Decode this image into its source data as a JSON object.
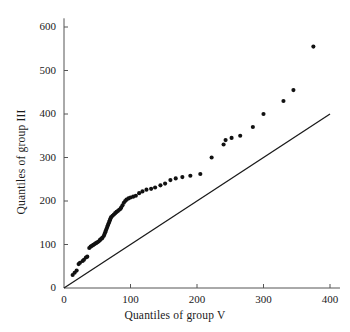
{
  "chart_data": {
    "type": "scatter",
    "title": "",
    "xlabel": "Quantiles of group V",
    "ylabel": "Quantiles of group III",
    "xlim": [
      0,
      415
    ],
    "ylim": [
      0,
      620
    ],
    "xticks": [
      0,
      100,
      200,
      300,
      400
    ],
    "yticks": [
      0,
      100,
      200,
      300,
      400,
      500,
      600
    ],
    "xticklabels": [
      "0",
      "100",
      "200",
      "300",
      "400"
    ],
    "yticklabels": [
      "0",
      "100",
      "200",
      "300",
      "400",
      "500",
      "600"
    ],
    "grid": false,
    "legend": null,
    "marker": "filled-circle",
    "marker_color": "#111111",
    "marker_size": 3,
    "axis_color": "#555555",
    "reference_line": {
      "name": "y = x line",
      "x": [
        0,
        400
      ],
      "y": [
        0,
        400
      ],
      "color": "#1a1a1a",
      "width": 1.3
    },
    "points": [
      [
        13,
        30
      ],
      [
        16,
        35
      ],
      [
        19,
        40
      ],
      [
        22,
        55
      ],
      [
        24,
        58
      ],
      [
        28,
        62
      ],
      [
        30,
        65
      ],
      [
        33,
        70
      ],
      [
        35,
        72
      ],
      [
        38,
        92
      ],
      [
        40,
        95
      ],
      [
        42,
        97
      ],
      [
        44,
        99
      ],
      [
        46,
        101
      ],
      [
        48,
        103
      ],
      [
        50,
        105
      ],
      [
        52,
        107
      ],
      [
        54,
        110
      ],
      [
        55,
        112
      ],
      [
        57,
        114
      ],
      [
        58,
        116
      ],
      [
        60,
        120
      ],
      [
        61,
        124
      ],
      [
        62,
        128
      ],
      [
        63,
        132
      ],
      [
        64,
        136
      ],
      [
        65,
        140
      ],
      [
        66,
        144
      ],
      [
        67,
        148
      ],
      [
        68,
        152
      ],
      [
        69,
        156
      ],
      [
        70,
        160
      ],
      [
        71,
        163
      ],
      [
        73,
        166
      ],
      [
        75,
        169
      ],
      [
        77,
        172
      ],
      [
        79,
        175
      ],
      [
        81,
        177
      ],
      [
        83,
        180
      ],
      [
        85,
        182
      ],
      [
        86,
        185
      ],
      [
        88,
        190
      ],
      [
        90,
        196
      ],
      [
        92,
        200
      ],
      [
        94,
        203
      ],
      [
        97,
        206
      ],
      [
        100,
        208
      ],
      [
        104,
        210
      ],
      [
        108,
        212
      ],
      [
        113,
        218
      ],
      [
        118,
        222
      ],
      [
        124,
        226
      ],
      [
        131,
        228
      ],
      [
        137,
        231
      ],
      [
        145,
        236
      ],
      [
        152,
        240
      ],
      [
        160,
        248
      ],
      [
        168,
        252
      ],
      [
        178,
        255
      ],
      [
        190,
        258
      ],
      [
        205,
        262
      ],
      [
        222,
        300
      ],
      [
        240,
        330
      ],
      [
        243,
        340
      ],
      [
        252,
        345
      ],
      [
        265,
        350
      ],
      [
        284,
        370
      ],
      [
        300,
        400
      ],
      [
        330,
        430
      ],
      [
        345,
        455
      ],
      [
        375,
        555
      ]
    ],
    "series_name": "sample quantiles"
  },
  "axis": {
    "x_title": "Quantiles of group V",
    "y_title": "Quantiles of group III"
  }
}
